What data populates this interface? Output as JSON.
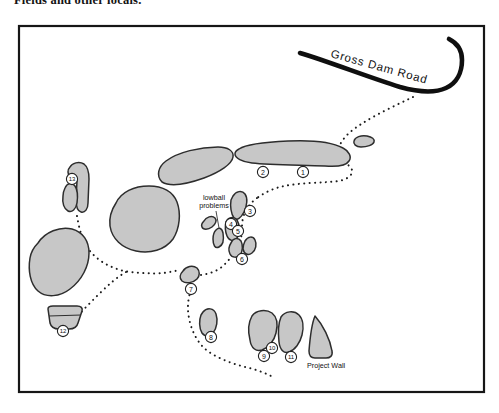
{
  "caption": "Fields and other locals.",
  "map": {
    "road_label": "Gross Dam Road",
    "lowball_label_line1": "lowball",
    "lowball_label_line2": "problems",
    "project_wall_label": "Project Wall",
    "colors": {
      "boulder_fill": "#c7c7c7",
      "boulder_stroke": "#2d2d2d",
      "road": "#0f0f0f",
      "trail": "#1c1c1c",
      "border": "#161616",
      "background": "#ffffff"
    },
    "markers": [
      {
        "n": "1",
        "x": 303,
        "y": 172
      },
      {
        "n": "2",
        "x": 263,
        "y": 172
      },
      {
        "n": "3",
        "x": 250,
        "y": 211
      },
      {
        "n": "4",
        "x": 231,
        "y": 224
      },
      {
        "n": "5",
        "x": 238,
        "y": 231
      },
      {
        "n": "6",
        "x": 242,
        "y": 259
      },
      {
        "n": "7",
        "x": 191,
        "y": 289
      },
      {
        "n": "8",
        "x": 211,
        "y": 337
      },
      {
        "n": "9",
        "x": 264,
        "y": 356
      },
      {
        "n": "10",
        "x": 272,
        "y": 348
      },
      {
        "n": "11",
        "x": 291,
        "y": 357
      },
      {
        "n": "12",
        "x": 63,
        "y": 331
      },
      {
        "n": "13",
        "x": 72,
        "y": 179
      }
    ]
  }
}
